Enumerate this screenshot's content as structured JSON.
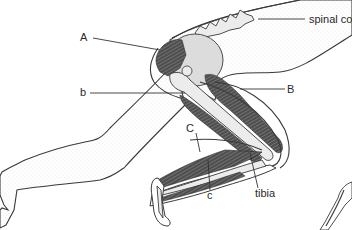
{
  "figure": {
    "labels": {
      "A": "A",
      "b": "b",
      "B": "B",
      "C": "C",
      "c": "c",
      "tibia": "tibia",
      "spinal_cord": "spinal co"
    }
  }
}
